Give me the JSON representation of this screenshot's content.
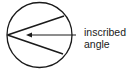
{
  "diagram": {
    "label_lines": [
      "inscribed",
      "angle"
    ],
    "colors": {
      "stroke": "#1a1a1a",
      "background": "#ffffff"
    },
    "circle": {
      "cx": 39.5,
      "cy": 35,
      "r": 32.5
    },
    "vertex": {
      "x": 7.5,
      "y": 35
    },
    "chord_ends": [
      {
        "x": 64,
        "y": 16
      },
      {
        "x": 63,
        "y": 54
      }
    ],
    "arrow": {
      "from_x": 76,
      "to_x": 27,
      "y": 35
    }
  }
}
